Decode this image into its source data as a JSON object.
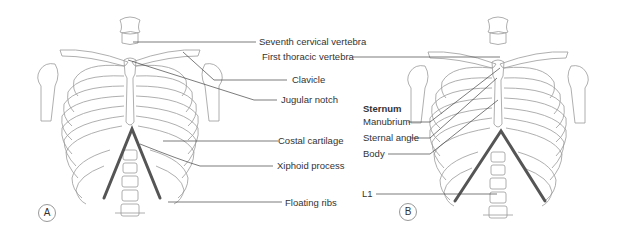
{
  "figure": {
    "panels": [
      {
        "id": "A",
        "label": "A"
      },
      {
        "id": "B",
        "label": "B"
      }
    ],
    "panel_a_labels": [
      {
        "text": "Seventh cervical vertebra"
      },
      {
        "text": "Clavicle"
      },
      {
        "text": "Jugular notch"
      },
      {
        "text": "Costal cartilage"
      },
      {
        "text": "Xiphoid process"
      },
      {
        "text": "Floating ribs"
      }
    ],
    "panel_b_labels": {
      "first_thoracic": "First thoracic vertebra",
      "sternum_heading": "Sternum",
      "manubrium": "Manubrium",
      "sternal_angle": "Sternal angle",
      "body": "Body",
      "l1": "L1"
    },
    "colors": {
      "line": "#444444",
      "bone_outline": "#999999",
      "costal_margin": "#555555"
    }
  }
}
